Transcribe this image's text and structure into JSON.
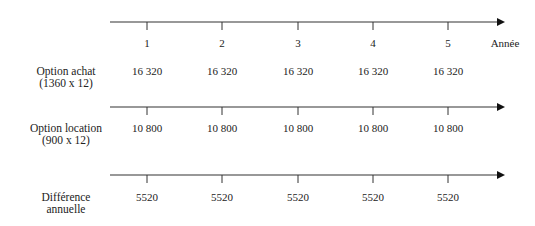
{
  "axis": {
    "years": [
      "1",
      "2",
      "3",
      "4",
      "5"
    ],
    "unit_label": "Année"
  },
  "rows": [
    {
      "label_line1": "Option achat",
      "label_line2": "(1360 x 12)",
      "values": [
        "16 320",
        "16 320",
        "16 320",
        "16 320",
        "16 320"
      ]
    },
    {
      "label_line1": "Option location",
      "label_line2": "(900 x 12)",
      "values": [
        "10 800",
        "10 800",
        "10 800",
        "10 800",
        "10 800"
      ]
    },
    {
      "label_line1": "Différence",
      "label_line2": "annuelle",
      "values": [
        "5520",
        "5520",
        "5520",
        "5520",
        "5520"
      ]
    }
  ]
}
